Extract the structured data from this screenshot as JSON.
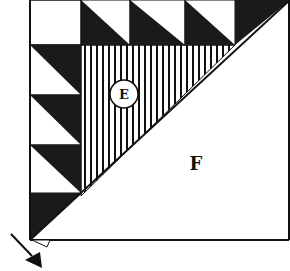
{
  "diagram": {
    "labels": {
      "e": "E",
      "f": "F"
    },
    "colors": {
      "ink": "#111111",
      "background": "#ffffff",
      "dark_fabric": "#1a1a1a",
      "hatch": "#111111"
    },
    "pieces": {
      "left_column_triangles": 4,
      "top_row_triangles": 4,
      "hatched_triangle_label": "E",
      "large_triangle_label": "F"
    },
    "arrow": {
      "direction": "down-right",
      "points_to": "bottom-left corner"
    }
  }
}
